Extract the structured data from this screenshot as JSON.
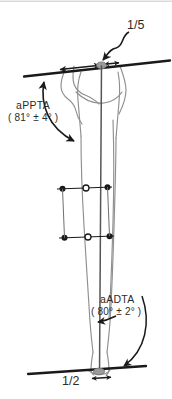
{
  "figure": {
    "kind": "lower-limb-radiographic-angle-diagram",
    "background_color": "#ffffff",
    "ink_color": "#1a1a1a",
    "bone_outline_color": "#8a8a8a",
    "marker_fill_color": "#9a9a9a",
    "top_border_color": "#d9d9d9",
    "width": 172,
    "height": 399
  },
  "annotations": {
    "proximal_fraction": {
      "label": "1/5",
      "numerator": "1",
      "denominator": "5"
    },
    "distal_fraction": {
      "label": "1/2",
      "numerator": "1",
      "denominator": "2"
    },
    "proximal_angle": {
      "name": "aPPTA",
      "value": "( 81° ± 4° )",
      "nominal": 81,
      "tolerance": 4,
      "unit": "°"
    },
    "distal_angle": {
      "name": "aADTA",
      "value": "( 80° ± 2° )",
      "nominal": 80,
      "tolerance": 2,
      "unit": "°"
    }
  }
}
